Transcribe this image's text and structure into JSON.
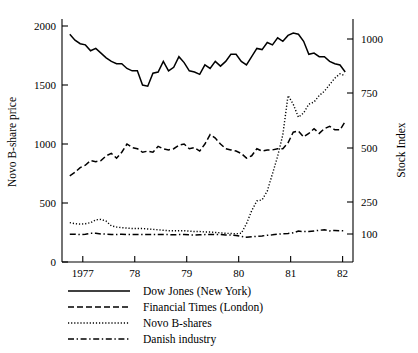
{
  "chart_data": {
    "type": "line",
    "title": "",
    "xlabel": "",
    "ylabel": "Novo B-share price",
    "y2label": "Stock Index",
    "grid": false,
    "legend_position": "below-left",
    "xlim": [
      1976.6,
      1982.2
    ],
    "ylim": [
      0,
      2100
    ],
    "y2lim": [
      0,
      1050
    ],
    "xticks": [
      "1977",
      "78",
      "79",
      "80",
      "81",
      "82"
    ],
    "xtick_values": [
      1977,
      1978,
      1979,
      1980,
      1981,
      1982
    ],
    "yticks": [
      "0",
      "500",
      "1000",
      "1500",
      "2000"
    ],
    "ytick_values": [
      0,
      500,
      1000,
      1500,
      2000
    ],
    "y2ticks": [
      "100",
      "250",
      "500",
      "750",
      "1000"
    ],
    "y2tick_values": [
      100,
      250,
      500,
      750,
      1000
    ],
    "series": [
      {
        "name": "Dow Jones (New York)",
        "style": "solid",
        "axis": "left",
        "x": [
          1976.75,
          1976.85,
          1976.95,
          1977.05,
          1977.15,
          1977.25,
          1977.35,
          1977.45,
          1977.55,
          1977.65,
          1977.75,
          1977.85,
          1977.95,
          1978.05,
          1978.15,
          1978.25,
          1978.35,
          1978.45,
          1978.55,
          1978.65,
          1978.75,
          1978.85,
          1978.95,
          1979.05,
          1979.15,
          1979.25,
          1979.35,
          1979.45,
          1979.55,
          1979.65,
          1979.75,
          1979.85,
          1979.95,
          1980.05,
          1980.15,
          1980.25,
          1980.35,
          1980.45,
          1980.55,
          1980.65,
          1980.75,
          1980.85,
          1980.95,
          1981.05,
          1981.15,
          1981.25,
          1981.35,
          1981.45,
          1981.55,
          1981.65,
          1981.75,
          1981.85,
          1981.95,
          1982.05
        ],
        "values": [
          1930,
          1880,
          1850,
          1840,
          1790,
          1810,
          1770,
          1730,
          1700,
          1680,
          1680,
          1640,
          1620,
          1620,
          1500,
          1490,
          1600,
          1610,
          1700,
          1620,
          1650,
          1740,
          1690,
          1620,
          1610,
          1590,
          1670,
          1640,
          1700,
          1660,
          1700,
          1760,
          1760,
          1700,
          1670,
          1740,
          1810,
          1800,
          1860,
          1840,
          1900,
          1870,
          1920,
          1940,
          1930,
          1870,
          1760,
          1770,
          1740,
          1740,
          1700,
          1680,
          1670,
          1610
        ]
      },
      {
        "name": "Financial Times (London)",
        "style": "dashed",
        "axis": "left",
        "x": [
          1976.75,
          1976.85,
          1976.95,
          1977.05,
          1977.15,
          1977.25,
          1977.35,
          1977.45,
          1977.55,
          1977.65,
          1977.75,
          1977.85,
          1977.95,
          1978.05,
          1978.15,
          1978.25,
          1978.35,
          1978.45,
          1978.55,
          1978.65,
          1978.75,
          1978.85,
          1978.95,
          1979.05,
          1979.15,
          1979.25,
          1979.35,
          1979.45,
          1979.55,
          1979.65,
          1979.75,
          1979.85,
          1979.95,
          1980.05,
          1980.15,
          1980.25,
          1980.35,
          1980.45,
          1980.55,
          1980.65,
          1980.75,
          1980.85,
          1980.95,
          1981.05,
          1981.15,
          1981.25,
          1981.35,
          1981.45,
          1981.55,
          1981.65,
          1981.75,
          1981.85,
          1981.95,
          1982.05
        ],
        "values": [
          730,
          760,
          800,
          820,
          860,
          850,
          860,
          900,
          920,
          880,
          930,
          1000,
          970,
          960,
          930,
          940,
          930,
          980,
          960,
          950,
          960,
          990,
          1000,
          960,
          970,
          940,
          1000,
          1080,
          1050,
          1000,
          960,
          950,
          940,
          920,
          880,
          900,
          960,
          940,
          950,
          950,
          960,
          960,
          1010,
          1100,
          1110,
          1060,
          1090,
          1130,
          1090,
          1130,
          1150,
          1120,
          1120,
          1190
        ]
      },
      {
        "name": "Novo B-shares",
        "style": "dotted",
        "axis": "right",
        "x": [
          1976.75,
          1976.85,
          1976.95,
          1977.05,
          1977.15,
          1977.25,
          1977.35,
          1977.45,
          1977.55,
          1977.65,
          1977.75,
          1977.85,
          1977.95,
          1978.05,
          1978.15,
          1978.25,
          1978.35,
          1978.45,
          1978.55,
          1978.65,
          1978.75,
          1978.85,
          1978.95,
          1979.05,
          1979.15,
          1979.25,
          1979.35,
          1979.45,
          1979.55,
          1979.65,
          1979.75,
          1979.85,
          1979.95,
          1980.05,
          1980.15,
          1980.25,
          1980.35,
          1980.45,
          1980.55,
          1980.65,
          1980.75,
          1980.85,
          1980.95,
          1981.05,
          1981.15,
          1981.25,
          1981.35,
          1981.45,
          1981.55,
          1981.65,
          1981.75,
          1981.85,
          1981.95,
          1982.05
        ],
        "values": [
          155,
          150,
          148,
          150,
          155,
          168,
          170,
          162,
          140,
          135,
          132,
          130,
          128,
          128,
          128,
          126,
          124,
          122,
          120,
          118,
          118,
          118,
          118,
          116,
          114,
          114,
          112,
          112,
          110,
          108,
          106,
          105,
          104,
          106,
          150,
          210,
          255,
          260,
          300,
          380,
          460,
          560,
          740,
          700,
          640,
          660,
          700,
          710,
          740,
          760,
          790,
          820,
          840,
          830
        ]
      },
      {
        "name": "Danish industry",
        "style": "dashdot",
        "axis": "right",
        "x": [
          1976.75,
          1976.85,
          1976.95,
          1977.05,
          1977.15,
          1977.25,
          1977.35,
          1977.45,
          1977.55,
          1977.65,
          1977.75,
          1977.85,
          1977.95,
          1978.05,
          1978.15,
          1978.25,
          1978.35,
          1978.45,
          1978.55,
          1978.65,
          1978.75,
          1978.85,
          1978.95,
          1979.05,
          1979.15,
          1979.25,
          1979.35,
          1979.45,
          1979.55,
          1979.65,
          1979.75,
          1979.85,
          1979.95,
          1980.05,
          1980.15,
          1980.25,
          1980.35,
          1980.45,
          1980.55,
          1980.65,
          1980.75,
          1980.85,
          1980.95,
          1981.05,
          1981.15,
          1981.25,
          1981.35,
          1981.45,
          1981.55,
          1981.65,
          1981.75,
          1981.85,
          1981.95,
          1982.05
        ],
        "values": [
          102,
          102,
          100,
          102,
          106,
          106,
          103,
          102,
          100,
          100,
          102,
          100,
          100,
          101,
          100,
          100,
          101,
          101,
          100,
          100,
          99,
          100,
          100,
          99,
          98,
          99,
          100,
          101,
          100,
          100,
          98,
          98,
          96,
          92,
          88,
          90,
          92,
          94,
          97,
          99,
          102,
          104,
          105,
          108,
          116,
          114,
          114,
          117,
          120,
          122,
          117,
          119,
          118,
          117
        ]
      }
    ]
  },
  "legend": {
    "items": [
      {
        "label": "Dow Jones (New York)",
        "style": "solid"
      },
      {
        "label": "Financial Times (London)",
        "style": "dashed"
      },
      {
        "label": "Novo B-shares",
        "style": "dotted"
      },
      {
        "label": "Danish industry",
        "style": "dashdot"
      }
    ]
  }
}
